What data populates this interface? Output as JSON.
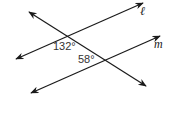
{
  "diagram": {
    "type": "parallel-lines-transversal",
    "lines": [
      {
        "id": "l",
        "label": "ℓ",
        "x1": 16,
        "y1": 59,
        "x2": 143,
        "y2": 3
      },
      {
        "id": "m",
        "label": "m",
        "x1": 31,
        "y1": 93,
        "x2": 160,
        "y2": 36
      },
      {
        "id": "transversal",
        "label": "",
        "x1": 29,
        "y1": 12,
        "x2": 146,
        "y2": 86
      }
    ],
    "angles": [
      {
        "label": "132°",
        "x": 53,
        "y": 50
      },
      {
        "label": "58°",
        "x": 78,
        "y": 63
      }
    ],
    "stroke_color": "#1a1a1a",
    "text_color": "#333333"
  }
}
